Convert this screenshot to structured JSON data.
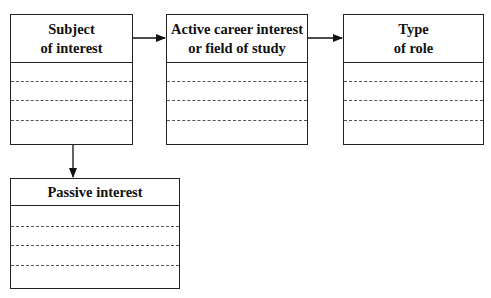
{
  "diagram": {
    "boxes": [
      {
        "id": "subject",
        "title_lines": [
          "Subject",
          "of interest"
        ],
        "blank_rows": 4
      },
      {
        "id": "active",
        "title_lines": [
          "Active career interest",
          "or field of study"
        ],
        "blank_rows": 4
      },
      {
        "id": "role",
        "title_lines": [
          "Type",
          "of role"
        ],
        "blank_rows": 4
      },
      {
        "id": "passive",
        "title_lines": [
          "Passive interest"
        ],
        "blank_rows": 4
      }
    ],
    "edges": [
      {
        "from": "subject",
        "to": "active"
      },
      {
        "from": "active",
        "to": "role"
      },
      {
        "from": "subject",
        "to": "passive"
      }
    ]
  }
}
